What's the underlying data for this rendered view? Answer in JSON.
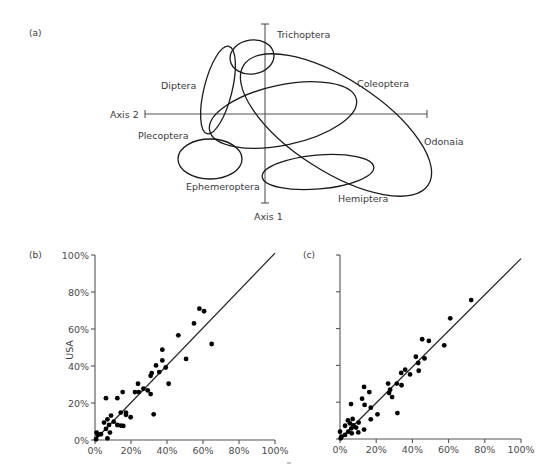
{
  "chart_data": [
    {
      "panel": "(a)",
      "type": "diagram",
      "title": "",
      "axes": {
        "horizontal": "Axis 2",
        "vertical": "Axis 1"
      },
      "groups": [
        "Trichoptera",
        "Diptera",
        "Coleoptera",
        "Plecoptera",
        "Odonaia",
        "Ephemeroptera",
        "Hemiptera"
      ]
    },
    {
      "panel": "(b)",
      "type": "scatter",
      "title": "",
      "xlabel": "",
      "ylabel": "USA",
      "xlim": [
        0,
        100
      ],
      "ylim": [
        0,
        100
      ],
      "xticks": [
        "0%",
        "20%",
        "40%",
        "60%",
        "80%",
        "100%"
      ],
      "yticks": [
        "0%",
        "20%",
        "40%",
        "60%",
        "80%",
        "100%"
      ],
      "grid": false,
      "fit_line": {
        "from": [
          0,
          0
        ],
        "to": [
          100,
          101
        ]
      },
      "points": [
        [
          58,
          71
        ],
        [
          60.6,
          69.6
        ],
        [
          55,
          63
        ],
        [
          64.8,
          51.9
        ],
        [
          46.3,
          56.6
        ],
        [
          50.6,
          43.8
        ],
        [
          37.4,
          48.8
        ],
        [
          37.4,
          43
        ],
        [
          39.3,
          39.2
        ],
        [
          33.9,
          40.3
        ],
        [
          35.7,
          36.7
        ],
        [
          31.5,
          36.2
        ],
        [
          30.9,
          34.7
        ],
        [
          40.9,
          30.4
        ],
        [
          23.9,
          30.4
        ],
        [
          22.2,
          25.9
        ],
        [
          24.3,
          25.9
        ],
        [
          26.9,
          27.7
        ],
        [
          29.3,
          26.8
        ],
        [
          30.9,
          24.8
        ],
        [
          32.6,
          13.9
        ],
        [
          6.1,
          22.6
        ],
        [
          12.4,
          22.6
        ],
        [
          15.4,
          25.9
        ],
        [
          14.3,
          14.8
        ],
        [
          17.2,
          14.8
        ],
        [
          17.2,
          13.6
        ],
        [
          19.8,
          12.3
        ],
        [
          8.9,
          13.2
        ],
        [
          10.4,
          9.9
        ],
        [
          12.4,
          8.1
        ],
        [
          14.3,
          7.8
        ],
        [
          15.7,
          7.6
        ],
        [
          5.0,
          9.4
        ],
        [
          6.9,
          11.2
        ],
        [
          7.8,
          8.1
        ],
        [
          6.1,
          6.0
        ],
        [
          8.3,
          4.0
        ],
        [
          6.9,
          0.9
        ],
        [
          3.3,
          3.1
        ],
        [
          0.9,
          4.0
        ],
        [
          1.5,
          2.7
        ],
        [
          0.6,
          0.4
        ]
      ]
    },
    {
      "panel": "(c)",
      "type": "scatter",
      "title": "",
      "xlabel": "",
      "ylabel": "",
      "xlim": [
        0,
        100
      ],
      "ylim": [
        0,
        100
      ],
      "xticks": [
        "0%",
        "20%",
        "40%",
        "60%",
        "80%",
        "100%"
      ],
      "yticks": [
        "",
        "",
        "",
        "",
        "",
        ""
      ],
      "grid": false,
      "fit_line": {
        "from": [
          0,
          0
        ],
        "to": [
          100,
          98
        ]
      },
      "points": [
        [
          72.5,
          75.5
        ],
        [
          60.9,
          65.6
        ],
        [
          45.4,
          54.2
        ],
        [
          49.1,
          53.3
        ],
        [
          57.6,
          50.9
        ],
        [
          41.9,
          44.7
        ],
        [
          46.7,
          43.8
        ],
        [
          43.2,
          41.3
        ],
        [
          43.5,
          37.1
        ],
        [
          36.0,
          37.7
        ],
        [
          33.8,
          35.9
        ],
        [
          38.7,
          35.1
        ],
        [
          26.6,
          30.1
        ],
        [
          31.4,
          30.1
        ],
        [
          34.0,
          29.2
        ],
        [
          27.7,
          26.8
        ],
        [
          27.1,
          25.0
        ],
        [
          28.8,
          22.8
        ],
        [
          31.7,
          14.1
        ],
        [
          13.3,
          28.3
        ],
        [
          16.2,
          25.5
        ],
        [
          12.2,
          21.9
        ],
        [
          13.6,
          18.5
        ],
        [
          6.1,
          19.0
        ],
        [
          17.0,
          17.0
        ],
        [
          20.7,
          13.4
        ],
        [
          17.0,
          10.7
        ],
        [
          13.3,
          5.1
        ],
        [
          10.1,
          3.6
        ],
        [
          4.4,
          10.1
        ],
        [
          7.0,
          10.9
        ],
        [
          10.3,
          8.9
        ],
        [
          2.8,
          7.2
        ],
        [
          5.5,
          8.5
        ],
        [
          7.4,
          7.4
        ],
        [
          6.3,
          5.8
        ],
        [
          8.9,
          6.2
        ],
        [
          4.6,
          4.0
        ],
        [
          2.8,
          2.2
        ],
        [
          0.9,
          1.3
        ],
        [
          0,
          4.0
        ],
        [
          0.4,
          0.4
        ],
        [
          6.5,
          3.1
        ]
      ]
    }
  ]
}
